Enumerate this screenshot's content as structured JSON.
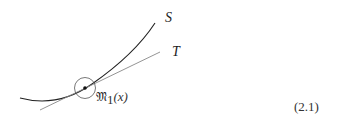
{
  "diagram": {
    "curve_label": "S",
    "tangent_label": "T",
    "neighborhood_label": "𝔐",
    "neighborhood_subscript": "1",
    "neighborhood_arg": "(x)",
    "equation_number": "(2.1)"
  },
  "colors": {
    "curve": "#222222",
    "tangent": "#888888",
    "circle": "#555555",
    "text": "#222222"
  }
}
